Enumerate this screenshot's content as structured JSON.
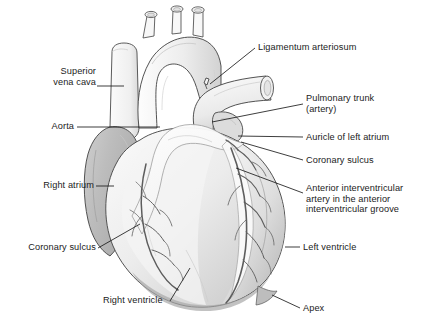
{
  "figure": {
    "style": "grayscale line drawing with shading",
    "background_color": "#ffffff",
    "line_color": "#3a3a3a",
    "text_color": "#1b1b1b",
    "shade_light": "#f2f2f2",
    "shade_mid": "#d6d6d6",
    "shade_dark": "#b0b0b0",
    "vessel_color": "#5a5a5a"
  },
  "labels": {
    "superior_vena_cava": "Superior\nvena cava",
    "aorta": "Aorta",
    "right_atrium": "Right atrium",
    "coronary_sulcus_left": "Coronary sulcus",
    "right_ventricle": "Right ventricle",
    "ligamentum_arteriosum": "Ligamentum arteriosum",
    "pulmonary_trunk": "Pulmonary trunk\n(artery)",
    "auricle_of_left_atrium": "Auricle of left atrium",
    "coronary_sulcus_right": "Coronary sulcus",
    "anterior_interventricular_artery": "Anterior interventricular\nartery in the anterior\ninterventricular groove",
    "left_ventricle": "Left ventricle",
    "apex": "Apex"
  },
  "structures": [
    "superior vena cava",
    "aortic arch",
    "ascending aorta",
    "brachiocephalic trunk",
    "left common carotid artery",
    "left subclavian artery",
    "ligamentum arteriosum",
    "pulmonary trunk",
    "auricle of left atrium",
    "right atrium",
    "right ventricle",
    "left ventricle",
    "coronary sulcus",
    "anterior interventricular artery",
    "apex"
  ]
}
